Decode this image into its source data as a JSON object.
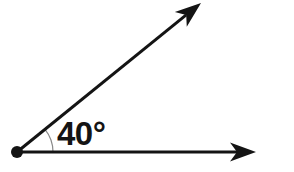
{
  "figure": {
    "kind": "geometry-angle-diagram",
    "background_color": "#ffffff",
    "stroke_color": "#141414",
    "arc_color": "#8a8a8a",
    "width": 294,
    "height": 172
  },
  "angle": {
    "label": "40°",
    "value": 40,
    "unit": "degrees",
    "degree_symbol": "°",
    "label_position": {
      "x": 57,
      "y": 145
    }
  },
  "vertex": {
    "name": "vertex-point",
    "x": 17,
    "y": 152,
    "radius": 6,
    "color": "#141414"
  },
  "rays": [
    {
      "name": "horizontal-ray",
      "from": {
        "x": 17,
        "y": 152
      },
      "to": {
        "x": 256,
        "y": 152
      },
      "arrowhead": "true",
      "direction_degrees": 0,
      "stroke_width": 3
    },
    {
      "name": "diagonal-ray",
      "from": {
        "x": 17,
        "y": 152
      },
      "to": {
        "x": 201,
        "y": 3
      },
      "arrowhead": "true",
      "direction_degrees": 39,
      "stroke_width": 3
    }
  ],
  "arc": {
    "name": "angle-arc",
    "center": {
      "x": 17,
      "y": 152
    },
    "radius": 36,
    "start_degrees": 0,
    "end_degrees": 39,
    "stroke_width": 1.2,
    "color": "#8a8a8a"
  }
}
